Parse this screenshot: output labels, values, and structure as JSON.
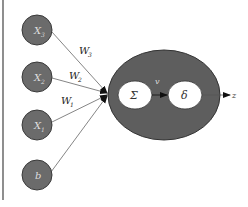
{
  "diagram": {
    "type": "perceptron",
    "inputs": [
      {
        "label": "X",
        "subscript": "3",
        "cy": 30
      },
      {
        "label": "X",
        "subscript": "2",
        "cy": 77
      },
      {
        "label": "X",
        "subscript": "1",
        "cy": 125
      },
      {
        "label": "b",
        "subscript": "",
        "cy": 175
      }
    ],
    "weights": [
      {
        "label": "W",
        "subscript": "3"
      },
      {
        "label": "W",
        "subscript": "2"
      },
      {
        "label": "W",
        "subscript": "1"
      }
    ],
    "neuron": {
      "sum_symbol": "Σ",
      "activation_symbol": "δ",
      "intermediate_label": "v"
    },
    "output_label": "z",
    "colors": {
      "node_fill": "#6b6b6b",
      "node_stroke": "#3a3a3a",
      "neuron_fill": "#5e5e5e",
      "inner_fill": "#ffffff",
      "line": "#555555",
      "border": "#444444",
      "label_text": "#dddddd"
    }
  }
}
